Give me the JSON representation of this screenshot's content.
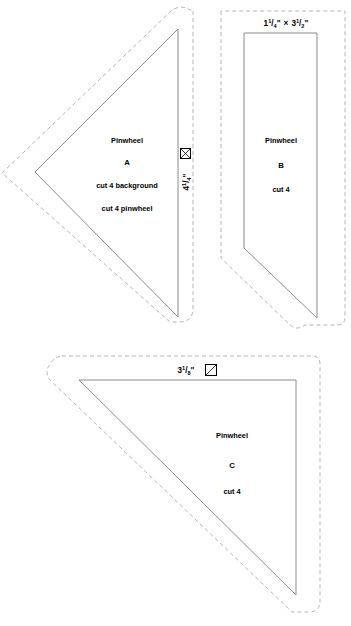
{
  "sheet": {
    "title": "Pinwheel quilt block template sheet",
    "background_color": "#ffffff",
    "cut_line_color": "#8a8a8a",
    "seam_line_color": "#b4b4b4",
    "text_color": "#000000"
  },
  "templates": [
    {
      "id": "A",
      "pattern_name": "Pinwheel",
      "letter": "A",
      "cut_line_1": "cut 4 background",
      "cut_line_2": "cut 4 pinwheel",
      "dimension": {
        "whole": "4",
        "numerator": "1",
        "denominator": "4",
        "unit": "\"",
        "full": "4 1/4\"",
        "orientation": "vertical"
      },
      "icon": "quarter-square-triangle-icon",
      "shape": "right-triangle"
    },
    {
      "id": "B",
      "pattern_name": "Pinwheel",
      "letter": "B",
      "cut_line_1": "cut 4",
      "cut_line_2": "",
      "dimension": {
        "whole_1": "1",
        "numerator_1": "1",
        "denominator_1": "4",
        "unit_1": "\"",
        "times": "×",
        "whole_2": "3",
        "numerator_2": "1",
        "denominator_2": "2",
        "unit_2": "\"",
        "full": "1 1/4\" × 3 1/2\"",
        "orientation": "horizontal"
      },
      "icon": "none",
      "shape": "quadrilateral"
    },
    {
      "id": "C",
      "pattern_name": "Pinwheel",
      "letter": "C",
      "cut_line_1": "cut 4",
      "cut_line_2": "",
      "dimension": {
        "whole": "3",
        "numerator": "1",
        "denominator": "8",
        "unit": "\"",
        "full": "3 1/8\"",
        "orientation": "horizontal"
      },
      "icon": "half-square-triangle-icon",
      "shape": "right-triangle"
    }
  ]
}
